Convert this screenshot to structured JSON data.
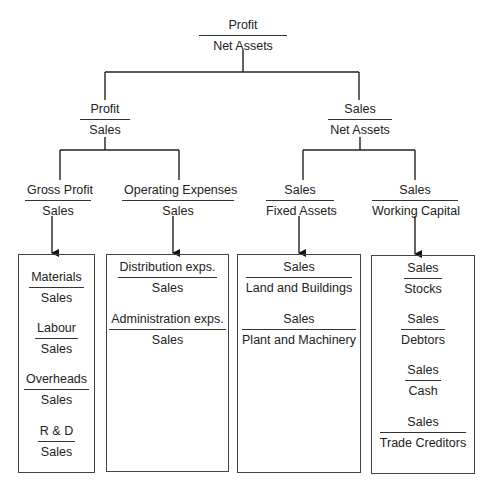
{
  "diagram": {
    "type": "ratio-pyramid",
    "root": {
      "numerator": "Profit",
      "denominator": "Net Assets"
    },
    "level2": [
      {
        "numerator": "Profit",
        "denominator": "Sales"
      },
      {
        "numerator": "Sales",
        "denominator": "Net Assets"
      }
    ],
    "level3": [
      {
        "numerator": "Gross Profit",
        "denominator": "Sales"
      },
      {
        "numerator": "Operating Expenses",
        "denominator": "Sales"
      },
      {
        "numerator": "Sales",
        "denominator": "Fixed Assets"
      },
      {
        "numerator": "Sales",
        "denominator": "Working Capital"
      }
    ],
    "boxes": [
      {
        "items": [
          {
            "numerator": "Materials",
            "denominator": "Sales"
          },
          {
            "numerator": "Labour",
            "denominator": "Sales"
          },
          {
            "numerator": "Overheads",
            "denominator": "Sales"
          },
          {
            "numerator": "R & D",
            "denominator": "Sales"
          }
        ]
      },
      {
        "items": [
          {
            "numerator": "Distribution exps.",
            "denominator": "Sales"
          },
          {
            "numerator": "Administration exps.",
            "denominator": "Sales"
          }
        ]
      },
      {
        "items": [
          {
            "numerator": "Sales",
            "denominator": "Land and Buildings"
          },
          {
            "numerator": "Sales",
            "denominator": "Plant and Machinery"
          }
        ]
      },
      {
        "items": [
          {
            "numerator": "Sales",
            "denominator": "Stocks"
          },
          {
            "numerator": "Sales",
            "denominator": "Debtors"
          },
          {
            "numerator": "Sales",
            "denominator": "Cash"
          },
          {
            "numerator": "Sales",
            "denominator": "Trade Creditors"
          }
        ]
      }
    ]
  }
}
